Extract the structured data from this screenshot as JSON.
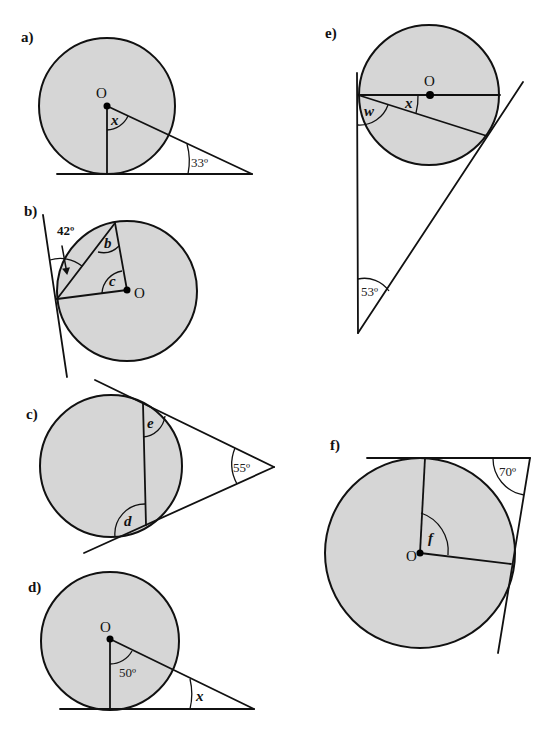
{
  "page": {
    "background": "#ffffff",
    "circle_fill": "#d6d6d6",
    "stroke_color": "#111111"
  },
  "diagrams": {
    "a": {
      "label": "a)",
      "center_label": "O",
      "unknown": "x",
      "given_angle": "33º"
    },
    "b": {
      "label": "b)",
      "center_label": "O",
      "given_angle": "42º",
      "unknowns": [
        "b",
        "c"
      ]
    },
    "c": {
      "label": "c)",
      "given_angle": "55º",
      "unknowns": [
        "e",
        "d"
      ]
    },
    "d": {
      "label": "d)",
      "center_label": "O",
      "given_angle": "50º",
      "unknown": "x"
    },
    "e": {
      "label": "e)",
      "center_label": "O",
      "unknowns": [
        "w",
        "x"
      ],
      "given_angle": "53º"
    },
    "f": {
      "label": "f)",
      "center_label": "O",
      "unknown": "f",
      "given_angle": "70º"
    }
  }
}
